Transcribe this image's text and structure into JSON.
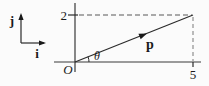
{
  "figure": {
    "type": "vector-diagram",
    "colors": {
      "background": "#fbfbfb",
      "line": "#2b2b2b",
      "dashed": "#8f8f8f",
      "text": "#1a1a1a"
    },
    "legend": {
      "j_label": "j",
      "i_label": "i"
    },
    "axes": {
      "origin_label": "O",
      "y_tick_label": "2",
      "x_tick_label": "5"
    },
    "vector": {
      "label": "p",
      "angle_label": "θ"
    }
  }
}
